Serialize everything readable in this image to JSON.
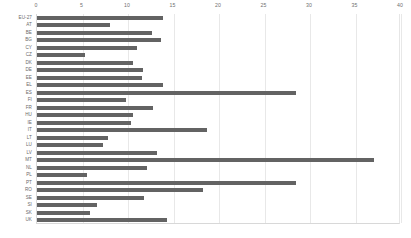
{
  "chart_data": {
    "type": "bar",
    "orientation": "horizontal",
    "title": "",
    "subtitle": "",
    "xlabel": "",
    "ylabel": "",
    "xlim": [
      0,
      40
    ],
    "ylim": null,
    "grid": true,
    "legend": null,
    "legend_position": "none",
    "xticks": [
      0,
      5,
      10,
      15,
      20,
      25,
      30,
      35,
      40
    ],
    "xtick_labels": [
      "0",
      "5",
      "10",
      "15",
      "20",
      "25",
      "30",
      "35",
      "40"
    ],
    "bar_color": "#636363",
    "grid_color": "#e8e8e8",
    "axis_color": "#d8d8d8",
    "tick_label_color": "#707070",
    "categories": [
      "EU-27",
      "AT",
      "BE",
      "BG",
      "CY",
      "CZ",
      "DK",
      "DE",
      "EE",
      "EL",
      "ES",
      "FI",
      "FR",
      "HU",
      "IE",
      "IT",
      "LT",
      "LU",
      "LV",
      "MT",
      "NL",
      "PL",
      "PT",
      "RO",
      "SE",
      "SI",
      "SK",
      "UK"
    ],
    "values": [
      13.8,
      8.0,
      12.6,
      13.6,
      11.0,
      5.3,
      10.5,
      11.7,
      11.5,
      13.8,
      28.5,
      9.8,
      12.8,
      10.5,
      10.3,
      18.7,
      7.8,
      7.2,
      13.2,
      37.0,
      12.1,
      5.5,
      28.5,
      18.2,
      11.8,
      6.6,
      5.8,
      14.3
    ],
    "series": [
      {
        "name": "value",
        "values": [
          13.8,
          8.0,
          12.6,
          13.6,
          11.0,
          5.3,
          10.5,
          11.7,
          11.5,
          13.8,
          28.5,
          9.8,
          12.8,
          10.5,
          10.3,
          18.7,
          7.8,
          7.2,
          13.2,
          37.0,
          12.1,
          5.5,
          28.5,
          18.2,
          11.8,
          6.6,
          5.8,
          14.3
        ]
      }
    ]
  }
}
